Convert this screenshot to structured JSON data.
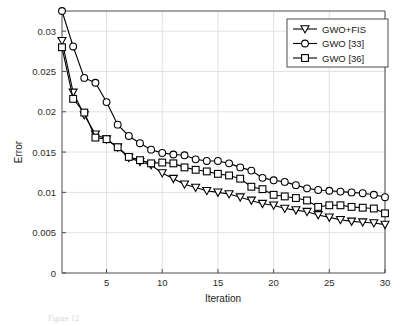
{
  "figure": {
    "caption_fragment": "Figure 12",
    "background": "#ffffff"
  },
  "chart_data": {
    "type": "line",
    "title": "",
    "xlabel": "Iteration",
    "ylabel": "Error",
    "xlim": [
      1,
      30
    ],
    "ylim": [
      0,
      0.0325
    ],
    "grid": true,
    "legend_position": "top-right",
    "xticks": [
      5,
      10,
      15,
      20,
      25,
      30
    ],
    "xtick_labels": [
      "5",
      "10",
      "15",
      "20",
      "25",
      "30"
    ],
    "yticks": [
      0,
      0.005,
      0.01,
      0.015,
      0.02,
      0.025,
      0.03
    ],
    "ytick_labels": [
      "0",
      "0.005",
      "0.01",
      "0.015",
      "0.02",
      "0.025",
      "0.03"
    ],
    "x": [
      1,
      2,
      3,
      4,
      5,
      6,
      7,
      8,
      9,
      10,
      11,
      12,
      13,
      14,
      15,
      16,
      17,
      18,
      19,
      20,
      21,
      22,
      23,
      24,
      25,
      26,
      27,
      28,
      29,
      30
    ],
    "series": [
      {
        "name": "GWO+FIS",
        "marker": "triangle-down",
        "color": "#000000",
        "values": [
          0.0288,
          0.0224,
          0.0196,
          0.0172,
          0.0166,
          0.0156,
          0.0143,
          0.0138,
          0.0134,
          0.0124,
          0.0117,
          0.011,
          0.0106,
          0.0102,
          0.01,
          0.0098,
          0.0094,
          0.009,
          0.0086,
          0.0084,
          0.008,
          0.0078,
          0.0076,
          0.0072,
          0.0069,
          0.0066,
          0.0064,
          0.0063,
          0.0062,
          0.006
        ]
      },
      {
        "name": "GWO [33]",
        "marker": "circle",
        "color": "#000000",
        "values": [
          0.0325,
          0.0281,
          0.0242,
          0.0236,
          0.0212,
          0.0184,
          0.017,
          0.0161,
          0.0153,
          0.0149,
          0.0147,
          0.0146,
          0.0141,
          0.0139,
          0.0139,
          0.0136,
          0.0131,
          0.0127,
          0.0118,
          0.0115,
          0.0113,
          0.0109,
          0.0105,
          0.0103,
          0.0102,
          0.0101,
          0.01,
          0.0099,
          0.0097,
          0.0094
        ]
      },
      {
        "name": "GWO [36]",
        "marker": "square",
        "color": "#000000",
        "values": [
          0.028,
          0.0216,
          0.0199,
          0.0168,
          0.0166,
          0.0156,
          0.0144,
          0.014,
          0.0136,
          0.0137,
          0.0136,
          0.0131,
          0.0128,
          0.0126,
          0.0123,
          0.0121,
          0.0117,
          0.0107,
          0.0104,
          0.0097,
          0.0095,
          0.0093,
          0.009,
          0.0082,
          0.0084,
          0.0084,
          0.0082,
          0.0081,
          0.008,
          0.0074
        ]
      }
    ]
  },
  "legend": {
    "entries": [
      {
        "label": "GWO+FIS",
        "marker": "triangle-down"
      },
      {
        "label": "GWO [33]",
        "marker": "circle"
      },
      {
        "label": "GWO [36]",
        "marker": "square"
      }
    ]
  }
}
